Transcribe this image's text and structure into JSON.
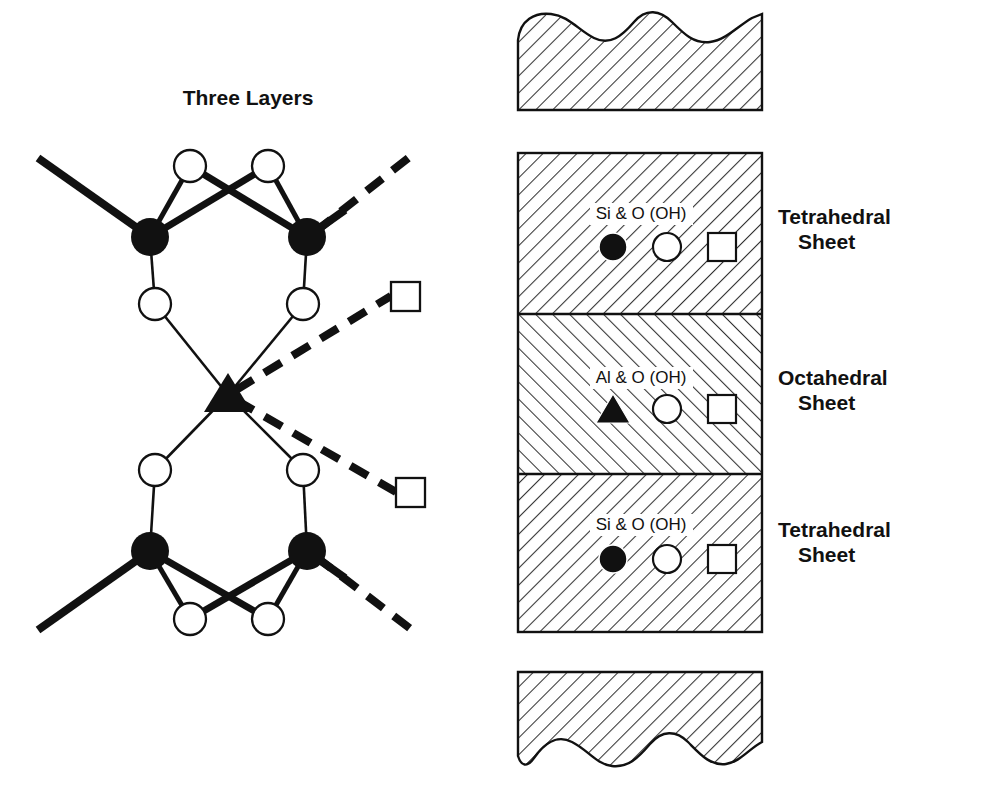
{
  "figure": {
    "left_panel": {
      "title": "Three Layers",
      "title_x": 248,
      "title_y": 105
    },
    "right_panel": {
      "sheets": [
        {
          "id": "tetrahedral-top",
          "label_line1": "Tetrahedral",
          "label_line2": "Sheet",
          "legend_text": "Si & O (OH)",
          "legend_symbols": [
            "filled-circle",
            "open-circle",
            "open-square"
          ],
          "hatch": "forward",
          "y_top": 153,
          "y_bottom": 314,
          "label_x": 778,
          "label_y1": 224,
          "label_y2": 249,
          "legend_text_x": 641,
          "legend_text_y": 219,
          "symbol_y": 247
        },
        {
          "id": "octahedral",
          "label_line1": "Octahedral",
          "label_line2": "Sheet",
          "legend_text": "Al & O (OH)",
          "legend_symbols": [
            "filled-triangle",
            "open-circle",
            "open-square"
          ],
          "hatch": "back",
          "y_top": 314,
          "y_bottom": 474,
          "label_x": 778,
          "label_y1": 385,
          "label_y2": 410,
          "legend_text_x": 641,
          "legend_text_y": 383,
          "symbol_y": 409
        },
        {
          "id": "tetrahedral-bottom",
          "label_line1": "Tetrahedral",
          "label_line2": "Sheet",
          "legend_text": "Si & O (OH)",
          "legend_symbols": [
            "filled-circle",
            "open-circle",
            "open-square"
          ],
          "hatch": "forward",
          "y_top": 474,
          "y_bottom": 632,
          "label_x": 778,
          "label_y1": 537,
          "label_y2": 562,
          "legend_text_x": 641,
          "legend_text_y": 530,
          "symbol_y": 559
        }
      ],
      "slab_x_left": 518,
      "slab_x_right": 762,
      "adjacent_slabs": [
        {
          "id": "slab-above",
          "edge": "wavy-top",
          "y_top": 18,
          "y_bottom": 110,
          "hatch": "forward"
        },
        {
          "id": "slab-below",
          "edge": "wavy-bottom",
          "y_top": 672,
          "y_bottom": 770,
          "hatch": "forward"
        }
      ]
    },
    "structure": {
      "si_atoms": [
        {
          "x": 150,
          "y": 237,
          "r": 19
        },
        {
          "x": 307,
          "y": 237,
          "r": 19
        },
        {
          "x": 150,
          "y": 551,
          "r": 19
        },
        {
          "x": 307,
          "y": 551,
          "r": 19
        }
      ],
      "al_atoms": [
        {
          "x": 228,
          "y": 395,
          "size": 23
        }
      ],
      "oxygen_atoms": [
        {
          "x": 190,
          "y": 166,
          "r": 16
        },
        {
          "x": 268,
          "y": 166,
          "r": 16
        },
        {
          "x": 155,
          "y": 304,
          "r": 16
        },
        {
          "x": 303,
          "y": 304,
          "r": 16
        },
        {
          "x": 155,
          "y": 470,
          "r": 16
        },
        {
          "x": 303,
          "y": 470,
          "r": 16
        },
        {
          "x": 190,
          "y": 619,
          "r": 16
        },
        {
          "x": 268,
          "y": 619,
          "r": 16
        }
      ],
      "squares": [
        {
          "x": 391,
          "y": 282,
          "size": 29
        },
        {
          "x": 396,
          "y": 478,
          "size": 29
        }
      ]
    },
    "colors": {
      "ink": "#111111",
      "fill_atom": "#111111",
      "open_fill": "#ffffff",
      "background": "#ffffff",
      "hatch_line": "#333333"
    }
  }
}
